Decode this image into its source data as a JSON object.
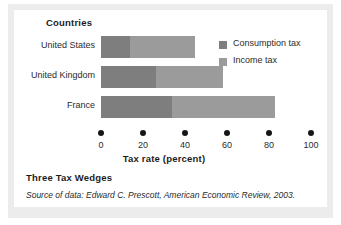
{
  "figure": {
    "title": "Three Tax Wedges",
    "source_prefix": "Source of data:",
    "source_author": "Edward C. Prescott,",
    "source_journal": "American Economic Review,",
    "source_year": "2003."
  },
  "colors": {
    "consumption": "#7e7e7e",
    "income": "#9b9b9b",
    "tick": "#161616",
    "card_background": "#ffffff",
    "page_tint": "#ececec"
  },
  "legend": {
    "position": "right",
    "items": [
      {
        "label": "Consumption tax",
        "key": "consumption"
      },
      {
        "label": "Income tax",
        "key": "income"
      }
    ]
  },
  "chart_data": {
    "type": "bar",
    "orientation": "horizontal",
    "stacked": true,
    "title": "Three Tax Wedges",
    "categories_heading": "Countries",
    "categories": [
      "United States",
      "United Kingdom",
      "France"
    ],
    "series": [
      {
        "name": "Consumption tax",
        "values": [
          14,
          26,
          34
        ]
      },
      {
        "name": "Income tax",
        "values": [
          31,
          32,
          49
        ]
      }
    ],
    "totals": [
      45,
      58,
      83
    ],
    "xlabel": "Tax rate (percent)",
    "ylabel": "Countries",
    "xlim": [
      0,
      100
    ],
    "xticks": [
      0,
      20,
      40,
      60,
      80,
      100
    ],
    "xtick_labels": [
      "0",
      "20",
      "40",
      "60",
      "80",
      "100"
    ],
    "grid": false,
    "legend_entries": [
      "Consumption tax",
      "Income tax"
    ]
  }
}
